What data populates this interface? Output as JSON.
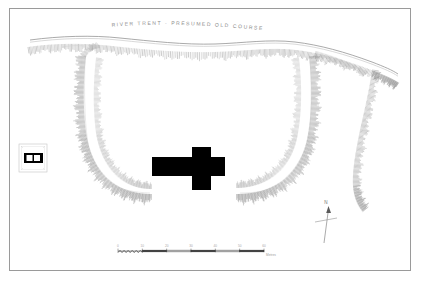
{
  "document": {
    "kind": "archaeological-earthwork-survey-plan",
    "frame": {
      "border_color": "#9a9a9a",
      "background": "#ffffff"
    }
  },
  "river": {
    "label": "RIVER TRENT - PRESUMED OLD COURSE",
    "label_letter_spacing": "1.5px",
    "stroke_color": "#8d8d8d"
  },
  "monument": {
    "church_name": "cruciform-church-plan",
    "fill_color": "#000000"
  },
  "earthworks": {
    "name": "hachured-enclosure-earthwork",
    "hachure_color": "#6e6e6e",
    "outline_color": "#9a9a9a"
  },
  "inset": {
    "name": "key-inset-box",
    "symbol": "building-block-symbol",
    "border_color": "#c4c4c4",
    "corner_marks": [
      "",
      "",
      "",
      ""
    ]
  },
  "north_arrow": {
    "label": "N",
    "color": "#6f6f6f"
  },
  "scale_bar": {
    "unit_label": "Metres",
    "ticks": [
      "0",
      "10",
      "20",
      "30",
      "40",
      "50",
      "60"
    ],
    "tick_values": [
      0,
      10,
      20,
      30,
      40,
      50,
      60
    ],
    "bar_color": "#3a3a3a",
    "hatch_segments": 6
  }
}
